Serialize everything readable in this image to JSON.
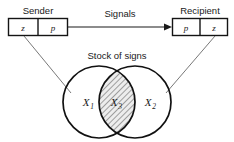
{
  "diagram": {
    "title_sender": "Sender",
    "title_recipient": "Recipient",
    "signals_label": "Signals",
    "stock_label": "Stock of signs",
    "sender_cells": [
      {
        "text": "z"
      },
      {
        "text": "p"
      }
    ],
    "recipient_cells": [
      {
        "text": "p"
      },
      {
        "text": "z"
      }
    ],
    "sets": [
      {
        "base": "X",
        "sub": "1"
      },
      {
        "base": "X",
        "sub": "3"
      },
      {
        "base": "X",
        "sub": "2"
      }
    ],
    "icons": {
      "arrow": "right-arrow-icon",
      "left_connector": "sender-to-stock-line-icon",
      "right_connector": "recipient-to-stock-line-icon",
      "left_circle": "set-circle-left-icon",
      "right_circle": "set-circle-right-icon",
      "intersection": "hatched-intersection-icon"
    },
    "colors": {
      "stroke": "#111111",
      "text": "#1a1a1a",
      "hatch": "#3a3a3a",
      "hatch_fill": "#e8e8e8",
      "background": "#ffffff",
      "thin_stroke": "#555555"
    }
  }
}
